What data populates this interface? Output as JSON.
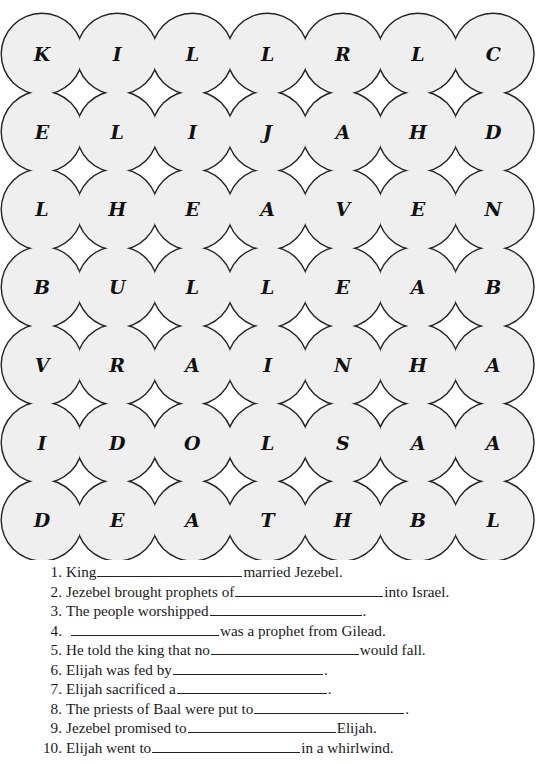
{
  "puzzle": {
    "grid": [
      [
        "K",
        "I",
        "L",
        "L",
        "R",
        "L",
        "C"
      ],
      [
        "E",
        "L",
        "I",
        "J",
        "A",
        "H",
        "D"
      ],
      [
        "L",
        "H",
        "E",
        "A",
        "V",
        "E",
        "N"
      ],
      [
        "B",
        "U",
        "L",
        "L",
        "E",
        "A",
        "B"
      ],
      [
        "V",
        "R",
        "A",
        "I",
        "N",
        "H",
        "A"
      ],
      [
        "I",
        "D",
        "O",
        "L",
        "S",
        "A",
        "A"
      ],
      [
        "D",
        "E",
        "A",
        "T",
        "H",
        "B",
        "L"
      ]
    ],
    "colors": {
      "circle_fill": "#efefef",
      "stroke": "#222222",
      "gap_fill": "#ffffff"
    }
  },
  "clues": [
    {
      "num": "1.",
      "before": "King",
      "blank_width": 145,
      "after": "married Jezebel."
    },
    {
      "num": "2.",
      "before": "Jezebel brought prophets of",
      "blank_width": 148,
      "after": "into Israel."
    },
    {
      "num": "3.",
      "before": "The people worshipped",
      "blank_width": 152,
      "after": "."
    },
    {
      "num": "4.",
      "before": "",
      "blank_width": 148,
      "after": "was a prophet from Gilead."
    },
    {
      "num": "5.",
      "before": "He told the king that no",
      "blank_width": 148,
      "after": "would fall."
    },
    {
      "num": "6.",
      "before": "Elijah was fed by",
      "blank_width": 150,
      "after": "."
    },
    {
      "num": "7.",
      "before": "Elijah sacrificed a",
      "blank_width": 150,
      "after": "."
    },
    {
      "num": "8.",
      "before": "The priests of Baal were put to",
      "blank_width": 150,
      "after": "."
    },
    {
      "num": "9.",
      "before": "Jezebel promised to",
      "blank_width": 148,
      "after": "Elijah."
    },
    {
      "num": "10.",
      "before": "Elijah went to",
      "blank_width": 148,
      "after": "in a whirlwind."
    }
  ]
}
